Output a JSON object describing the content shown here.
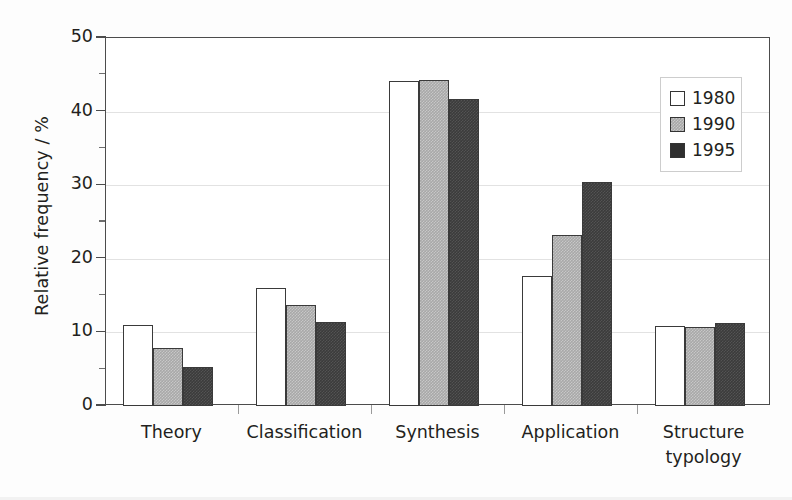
{
  "chart_data": {
    "type": "bar",
    "title": "",
    "xlabel": "",
    "ylabel": "Relative frequency / %",
    "categories": [
      "Theory",
      "Classification",
      "Synthesis",
      "Application",
      "Structure typology"
    ],
    "category_lines": [
      [
        "Theory"
      ],
      [
        "Classification"
      ],
      [
        "Synthesis"
      ],
      [
        "Application"
      ],
      [
        "Structure",
        "typology"
      ]
    ],
    "series": [
      {
        "name": "1980",
        "values": [
          11.0,
          16.1,
          44.1,
          17.6,
          10.9
        ],
        "color": "#ffffff",
        "swatch": "white-open"
      },
      {
        "name": "1990",
        "values": [
          7.9,
          13.7,
          44.3,
          23.2,
          10.8
        ],
        "color": "#a8a8a8",
        "swatch": "gray-hatched"
      },
      {
        "name": "1995",
        "values": [
          5.3,
          11.4,
          41.7,
          30.4,
          11.3
        ],
        "color": "#3b3b3b",
        "swatch": "dark-solid"
      }
    ],
    "ylim": [
      0,
      50
    ],
    "yticks": [
      0,
      10,
      20,
      30,
      40,
      50
    ],
    "ytick_labels": [
      "0",
      "10",
      "20",
      "30",
      "40",
      "50"
    ],
    "yminor_ticks": [
      5,
      15,
      25,
      35,
      45
    ],
    "grid": "horizontal",
    "legend_position": "upper-right",
    "legend_entries": [
      "1980",
      "1990",
      "1995"
    ]
  },
  "axis": {
    "y_title": "Relative frequency / %"
  },
  "legend": {
    "items": [
      {
        "label": "1980"
      },
      {
        "label": "1990"
      },
      {
        "label": "1995"
      }
    ]
  }
}
